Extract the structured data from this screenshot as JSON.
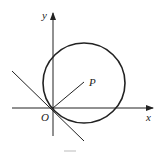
{
  "figure": {
    "labels": {
      "x_axis": "x",
      "y_axis": "y",
      "origin": "O",
      "point": "P"
    },
    "colors": {
      "stroke": "#222222",
      "background": "#ffffff"
    },
    "geometry": {
      "origin": [
        53,
        108
      ],
      "circle": {
        "cx": 84,
        "cy": 83,
        "rx": 42,
        "ry": 40
      },
      "segment_OP_end": [
        84,
        82
      ],
      "tangent_line": {
        "from": [
          12,
          71
        ],
        "to": [
          84,
          141
        ]
      }
    }
  }
}
